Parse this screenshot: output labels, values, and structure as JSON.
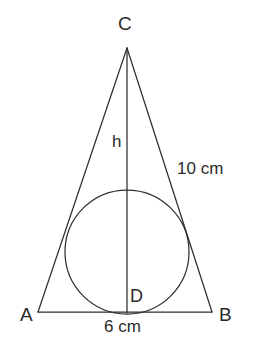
{
  "figure": {
    "stroke_color": "#2f2f2f",
    "background_color": "#ffffff",
    "text_color": "#2b2b2b"
  },
  "vertices": {
    "C": {
      "label": "C",
      "x": 127,
      "y": 48
    },
    "A": {
      "label": "A",
      "x": 38,
      "y": 312
    },
    "B": {
      "label": "B",
      "x": 212,
      "y": 312
    },
    "D": {
      "label": "D",
      "x": 127,
      "y": 312
    }
  },
  "segments": {
    "altitude": {
      "label": "h",
      "from": "C",
      "to": "D"
    },
    "side_right": {
      "label": "10 cm",
      "value": 10,
      "unit": "cm",
      "from": "C",
      "to": "B"
    },
    "base": {
      "label": "6 cm",
      "value": 6,
      "unit": "cm",
      "from": "A",
      "to": "B"
    }
  },
  "incircle": {
    "center_x": 127,
    "center_y": 252,
    "radius": 62
  },
  "geometry_paths": {
    "side_left": "M 127 48 L 38 312",
    "side_right": "M 127 48 L 212 312",
    "base": "M 38 312 L 212 312",
    "altitude": "M 127 48 L 127 313"
  }
}
